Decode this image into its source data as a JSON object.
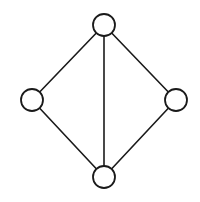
{
  "diagram": {
    "type": "undirected-graph",
    "style": {
      "stroke": "#1a1a1a",
      "fill": "#ffffff",
      "background": "#ffffff",
      "node_radius": 11
    },
    "nodes": [
      {
        "id": "top",
        "x": 104,
        "y": 25
      },
      {
        "id": "left",
        "x": 32,
        "y": 100
      },
      {
        "id": "right",
        "x": 176,
        "y": 100
      },
      {
        "id": "bottom",
        "x": 104,
        "y": 177
      }
    ],
    "edges": [
      {
        "from": "top",
        "to": "left"
      },
      {
        "from": "top",
        "to": "right"
      },
      {
        "from": "top",
        "to": "bottom"
      },
      {
        "from": "left",
        "to": "bottom"
      },
      {
        "from": "right",
        "to": "bottom"
      }
    ]
  }
}
